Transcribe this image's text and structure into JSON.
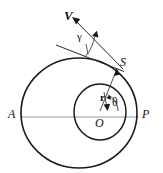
{
  "figure": {
    "type": "geometric-diagram",
    "canvas": {
      "width": 163,
      "height": 173,
      "background": "#ffffff"
    },
    "colors": {
      "curve": "#1a1a1a",
      "axis": "#9a9a9a",
      "vector": "#2a2a2a",
      "label": "#111111"
    },
    "labels": {
      "velocity": "V",
      "point_s": "S",
      "apoapsis": "A",
      "periapsis": "P",
      "origin": "O",
      "radius": "r",
      "true_anomaly": "θ",
      "flight_path_angle": "γ"
    },
    "shapes": {
      "outer_orbit": {
        "name": "outer-ellipse",
        "cx": 79,
        "cy": 113,
        "rx": 58,
        "ry": 55
      },
      "inner_orbit": {
        "name": "inner-circle",
        "cx": 100,
        "cy": 112,
        "rx": 26,
        "ry": 28
      },
      "apse_line": {
        "name": "apse-axis",
        "x1": 21,
        "y1": 117,
        "x2": 139,
        "y2": 117
      },
      "radius_vector": {
        "name": "radius-o-to-s",
        "x1": 100,
        "y1": 112,
        "x2": 117,
        "y2": 70
      },
      "velocity_vector": {
        "name": "velocity-at-s",
        "x1": 122,
        "y1": 67,
        "x2": 72,
        "y2": 18
      },
      "tangent": {
        "name": "tangent-at-s",
        "x1": 56,
        "y1": 45,
        "x2": 124,
        "y2": 72
      },
      "theta_arrow": {
        "name": "theta-angle-arrow",
        "from_deg": 0,
        "to_deg": 68
      },
      "gamma_arc": {
        "name": "gamma-angle-arc"
      }
    }
  }
}
